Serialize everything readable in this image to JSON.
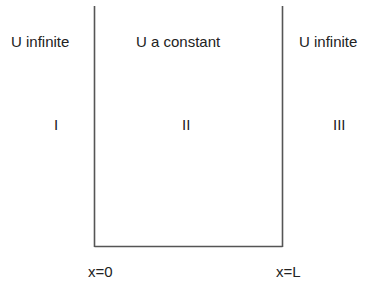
{
  "diagram": {
    "regions": [
      {
        "potential": "U infinite",
        "roman": "I"
      },
      {
        "potential": "U a constant",
        "roman": "II"
      },
      {
        "potential": "U infinite",
        "roman": "III"
      }
    ],
    "boundaries": [
      {
        "label": "x=0"
      },
      {
        "label": "x=L"
      }
    ],
    "line_color": "#555555"
  }
}
